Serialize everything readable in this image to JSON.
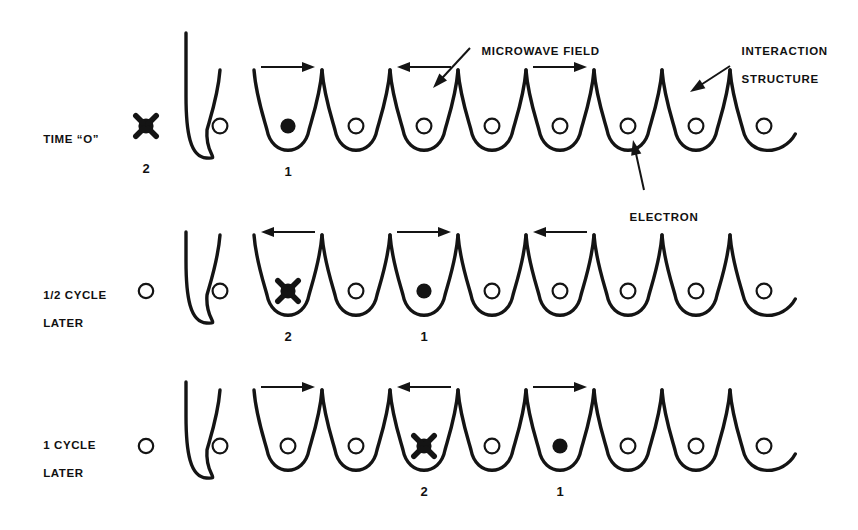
{
  "figure": {
    "background_color": "#ffffff",
    "ink_color": "#141414"
  },
  "callouts": [
    {
      "id": "microwave-field",
      "label": "MICROWAVE FIELD",
      "text_x": 466,
      "text_y": 30,
      "arrow_from_x": 470,
      "arrow_from_y": 48,
      "arrow_to_x": 433,
      "arrow_to_y": 88
    },
    {
      "id": "interaction-structure",
      "label_line1": "INTERACTION",
      "label_line2": "STRUCTURE",
      "text_x": 726,
      "text_y": 30,
      "arrow_from_x": 730,
      "arrow_from_y": 66,
      "arrow_to_x": 690,
      "arrow_to_y": 92
    },
    {
      "id": "electron",
      "label": "ELECTRON",
      "text_x": 614,
      "text_y": 196,
      "arrow_from_x": 644,
      "arrow_from_y": 190,
      "arrow_to_x": 633,
      "arrow_to_y": 140
    }
  ],
  "rows": [
    {
      "id": "row-time-zero",
      "label_line1": "TIME “O”",
      "label_line2": "",
      "label_x": 28,
      "label_y": 118,
      "baseline_y": 128,
      "structure_start_x": 186,
      "cell_pitch": 68,
      "cell_count": 9,
      "has_leading_vertical": true,
      "leading_vertical_top_y": 33,
      "outside_marker": {
        "type": "star",
        "x": 146,
        "y": 126,
        "number": "2",
        "number_x": 146,
        "number_y": 170
      },
      "particles": [
        {
          "cell": 0,
          "type": "open"
        },
        {
          "cell": 1,
          "type": "filled",
          "number": "1",
          "number_x": 288,
          "number_y": 170
        },
        {
          "cell": 2,
          "type": "open"
        },
        {
          "cell": 3,
          "type": "open"
        },
        {
          "cell": 4,
          "type": "open"
        },
        {
          "cell": 5,
          "type": "open"
        },
        {
          "cell": 6,
          "type": "open"
        },
        {
          "cell": 7,
          "type": "open"
        },
        {
          "cell": 8,
          "type": "open"
        }
      ],
      "arrows": [
        {
          "span_cell": 1,
          "direction": "right"
        },
        {
          "span_cell": 3,
          "direction": "left"
        },
        {
          "span_cell": 5,
          "direction": "right"
        }
      ]
    },
    {
      "id": "row-half-cycle",
      "label_line1": "1/2 CYCLE",
      "label_line2": "LATER",
      "label_x": 28,
      "label_y": 281,
      "baseline_y": 293,
      "structure_start_x": 186,
      "cell_pitch": 68,
      "cell_count": 9,
      "has_leading_vertical": true,
      "leading_vertical_top_y": 232,
      "outside_marker": {
        "type": "open",
        "x": 146,
        "y": 291,
        "number": "",
        "number_x": 146,
        "number_y": 334
      },
      "particles": [
        {
          "cell": 0,
          "type": "open"
        },
        {
          "cell": 1,
          "type": "star",
          "number": "2",
          "number_x": 288,
          "number_y": 336
        },
        {
          "cell": 2,
          "type": "open"
        },
        {
          "cell": 3,
          "type": "filled",
          "number": "1",
          "number_x": 424,
          "number_y": 336
        },
        {
          "cell": 4,
          "type": "open"
        },
        {
          "cell": 5,
          "type": "open"
        },
        {
          "cell": 6,
          "type": "open"
        },
        {
          "cell": 7,
          "type": "open"
        },
        {
          "cell": 8,
          "type": "open"
        }
      ],
      "arrows": [
        {
          "span_cell": 1,
          "direction": "left"
        },
        {
          "span_cell": 3,
          "direction": "right"
        },
        {
          "span_cell": 5,
          "direction": "left"
        }
      ]
    },
    {
      "id": "row-one-cycle",
      "label_line1": "1 CYCLE",
      "label_line2": "LATER",
      "label_x": 28,
      "label_y": 430,
      "baseline_y": 448,
      "structure_start_x": 186,
      "cell_pitch": 68,
      "cell_count": 9,
      "has_leading_vertical": true,
      "leading_vertical_top_y": 382,
      "outside_marker": {
        "type": "open",
        "x": 146,
        "y": 446,
        "number": "",
        "number_x": 146,
        "number_y": 490
      },
      "particles": [
        {
          "cell": 0,
          "type": "open"
        },
        {
          "cell": 1,
          "type": "open"
        },
        {
          "cell": 2,
          "type": "open"
        },
        {
          "cell": 3,
          "type": "star",
          "number": "2",
          "number_x": 424,
          "number_y": 490
        },
        {
          "cell": 4,
          "type": "open"
        },
        {
          "cell": 5,
          "type": "filled",
          "number": "1",
          "number_x": 560,
          "number_y": 490
        },
        {
          "cell": 6,
          "type": "open"
        },
        {
          "cell": 7,
          "type": "open"
        },
        {
          "cell": 8,
          "type": "open"
        }
      ],
      "arrows": [
        {
          "span_cell": 1,
          "direction": "right"
        },
        {
          "span_cell": 3,
          "direction": "left"
        },
        {
          "span_cell": 5,
          "direction": "right"
        }
      ]
    }
  ],
  "legend": {
    "open_circle_meaning": "electron position marker",
    "filled_circle_meaning": "electron 1",
    "star_circle_meaning": "electron 2"
  }
}
